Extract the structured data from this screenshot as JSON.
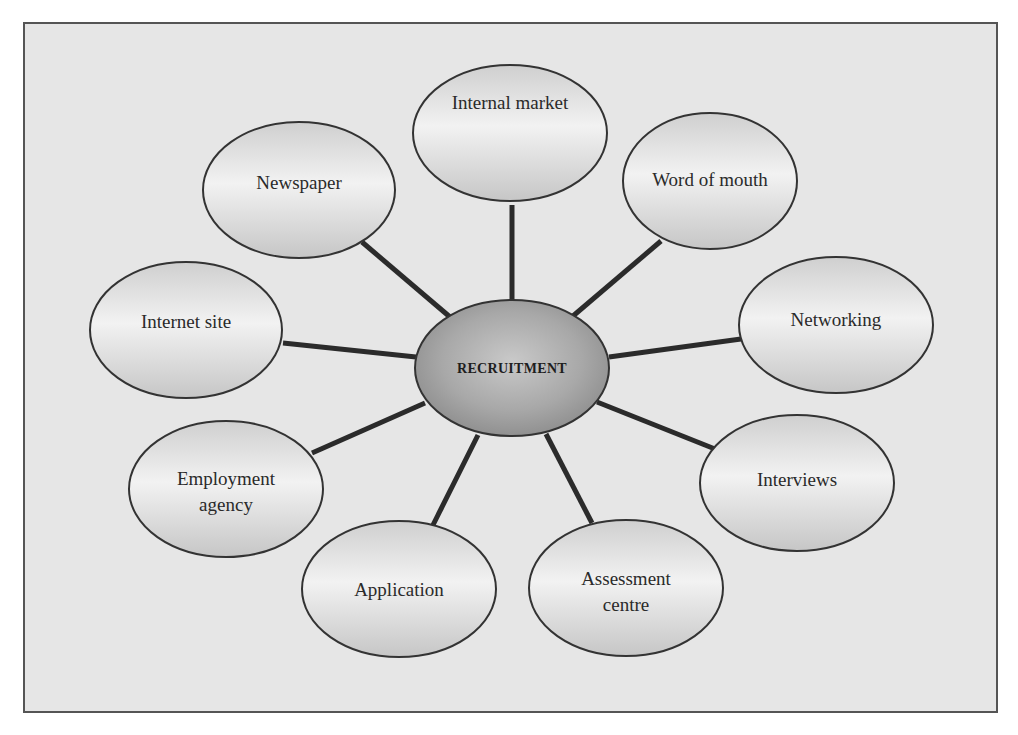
{
  "diagram": {
    "type": "mind-map",
    "colors": {
      "background": "#e6e6e6",
      "frame_border": "#555555",
      "connector": "#2b2b2b",
      "ellipse_stroke": "#333333",
      "center_fill_dark": "#8e8e8e",
      "center_fill_light": "#c8c8c8",
      "leaf_fill_dark": "#c4c4c4",
      "leaf_fill_light": "#f4f4f4",
      "text": "#2a2a2a"
    },
    "center": {
      "label": "RECRUITMENT",
      "cx": 512,
      "cy": 368,
      "rx": 97,
      "ry": 68
    },
    "nodes": [
      {
        "id": "internal-market",
        "lines": [
          "Internal market"
        ],
        "cx": 510,
        "cy": 133,
        "rx": 97,
        "ry": 68,
        "text_y": 103,
        "line": [
          512,
          205,
          512,
          300
        ]
      },
      {
        "id": "word-of-mouth",
        "lines": [
          "Word of mouth"
        ],
        "cx": 710,
        "cy": 181,
        "rx": 87,
        "ry": 68,
        "text_y": 180,
        "line": [
          661,
          241,
          573,
          316
        ]
      },
      {
        "id": "networking",
        "lines": [
          "Networking"
        ],
        "cx": 836,
        "cy": 325,
        "rx": 97,
        "ry": 68,
        "text_y": 320,
        "line": [
          741,
          339,
          609,
          357
        ]
      },
      {
        "id": "interviews",
        "lines": [
          "Interviews"
        ],
        "cx": 797,
        "cy": 483,
        "rx": 97,
        "ry": 68,
        "text_y": 480,
        "line": [
          715,
          449,
          597,
          402
        ]
      },
      {
        "id": "assessment-centre",
        "lines": [
          "Assessment",
          "centre"
        ],
        "cx": 626,
        "cy": 588,
        "rx": 97,
        "ry": 68,
        "text_y": 579,
        "line": [
          592,
          523,
          546,
          434
        ]
      },
      {
        "id": "application",
        "lines": [
          "Application"
        ],
        "cx": 399,
        "cy": 589,
        "rx": 97,
        "ry": 68,
        "text_y": 590,
        "line": [
          433,
          525,
          478,
          435
        ]
      },
      {
        "id": "employment-agency",
        "lines": [
          "Employment",
          "agency"
        ],
        "cx": 226,
        "cy": 489,
        "rx": 97,
        "ry": 68,
        "text_y": 479,
        "line": [
          312,
          453,
          425,
          403
        ]
      },
      {
        "id": "internet-site",
        "lines": [
          "Internet site"
        ],
        "cx": 186,
        "cy": 330,
        "rx": 96,
        "ry": 68,
        "text_y": 322,
        "line": [
          283,
          343,
          416,
          357
        ]
      },
      {
        "id": "newspaper",
        "lines": [
          "Newspaper"
        ],
        "cx": 299,
        "cy": 190,
        "rx": 96,
        "ry": 68,
        "text_y": 183,
        "line": [
          362,
          242,
          450,
          317
        ]
      }
    ]
  }
}
